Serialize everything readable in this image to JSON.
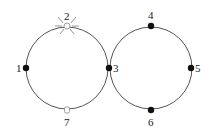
{
  "diagram": {
    "title": "",
    "rings": [
      {
        "id": "left",
        "cx": 67,
        "cy": 68,
        "r": 41
      },
      {
        "id": "right",
        "cx": 151,
        "cy": 68,
        "r": 41
      }
    ],
    "nodes": [
      {
        "id": "1",
        "label": "1",
        "x": 26,
        "y": 68,
        "style": "solid"
      },
      {
        "id": "2",
        "label": "2",
        "x": 67,
        "y": 26,
        "style": "highlighted"
      },
      {
        "id": "3",
        "label": "3",
        "x": 109,
        "y": 68,
        "style": "solid"
      },
      {
        "id": "4",
        "label": "4",
        "x": 151,
        "y": 26,
        "style": "solid"
      },
      {
        "id": "5",
        "label": "5",
        "x": 191,
        "y": 68,
        "style": "solid"
      },
      {
        "id": "6",
        "label": "6",
        "x": 151,
        "y": 110,
        "style": "solid"
      },
      {
        "id": "7",
        "label": "7",
        "x": 67,
        "y": 110,
        "style": "hollow"
      }
    ],
    "colors": {
      "ring": "#555555",
      "node_solid": "#111111",
      "node_hollow_stroke": "#888888",
      "label": "#222222"
    }
  }
}
